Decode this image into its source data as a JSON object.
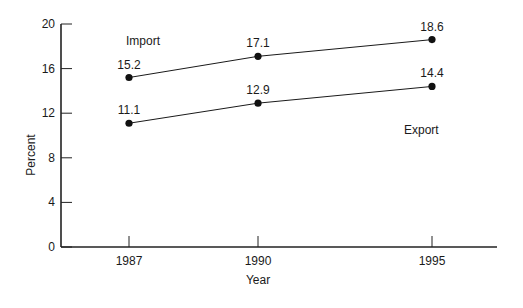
{
  "chart_data": {
    "type": "line",
    "title": "",
    "xlabel": "Year",
    "ylabel": "Percent",
    "x": [
      "1987",
      "1990",
      "1995"
    ],
    "x_numeric": [
      1987,
      1990,
      1995
    ],
    "ylim": [
      0,
      20
    ],
    "yticks": [
      "0",
      "4",
      "8",
      "12",
      "16",
      "20"
    ],
    "xticks": [
      "1987",
      "1990",
      "1995"
    ],
    "grid": false,
    "legend": "inline labels",
    "series": [
      {
        "name": "Import",
        "values": [
          15.2,
          17.1,
          18.6
        ],
        "value_labels": [
          "15.2",
          "17.1",
          "18.6"
        ]
      },
      {
        "name": "Export",
        "values": [
          11.1,
          12.9,
          14.4
        ],
        "value_labels": [
          "11.1",
          "12.9",
          "14.4"
        ]
      }
    ]
  },
  "colors": {
    "line": "#1a1a1a",
    "marker": "#111111",
    "axis": "#222222"
  }
}
